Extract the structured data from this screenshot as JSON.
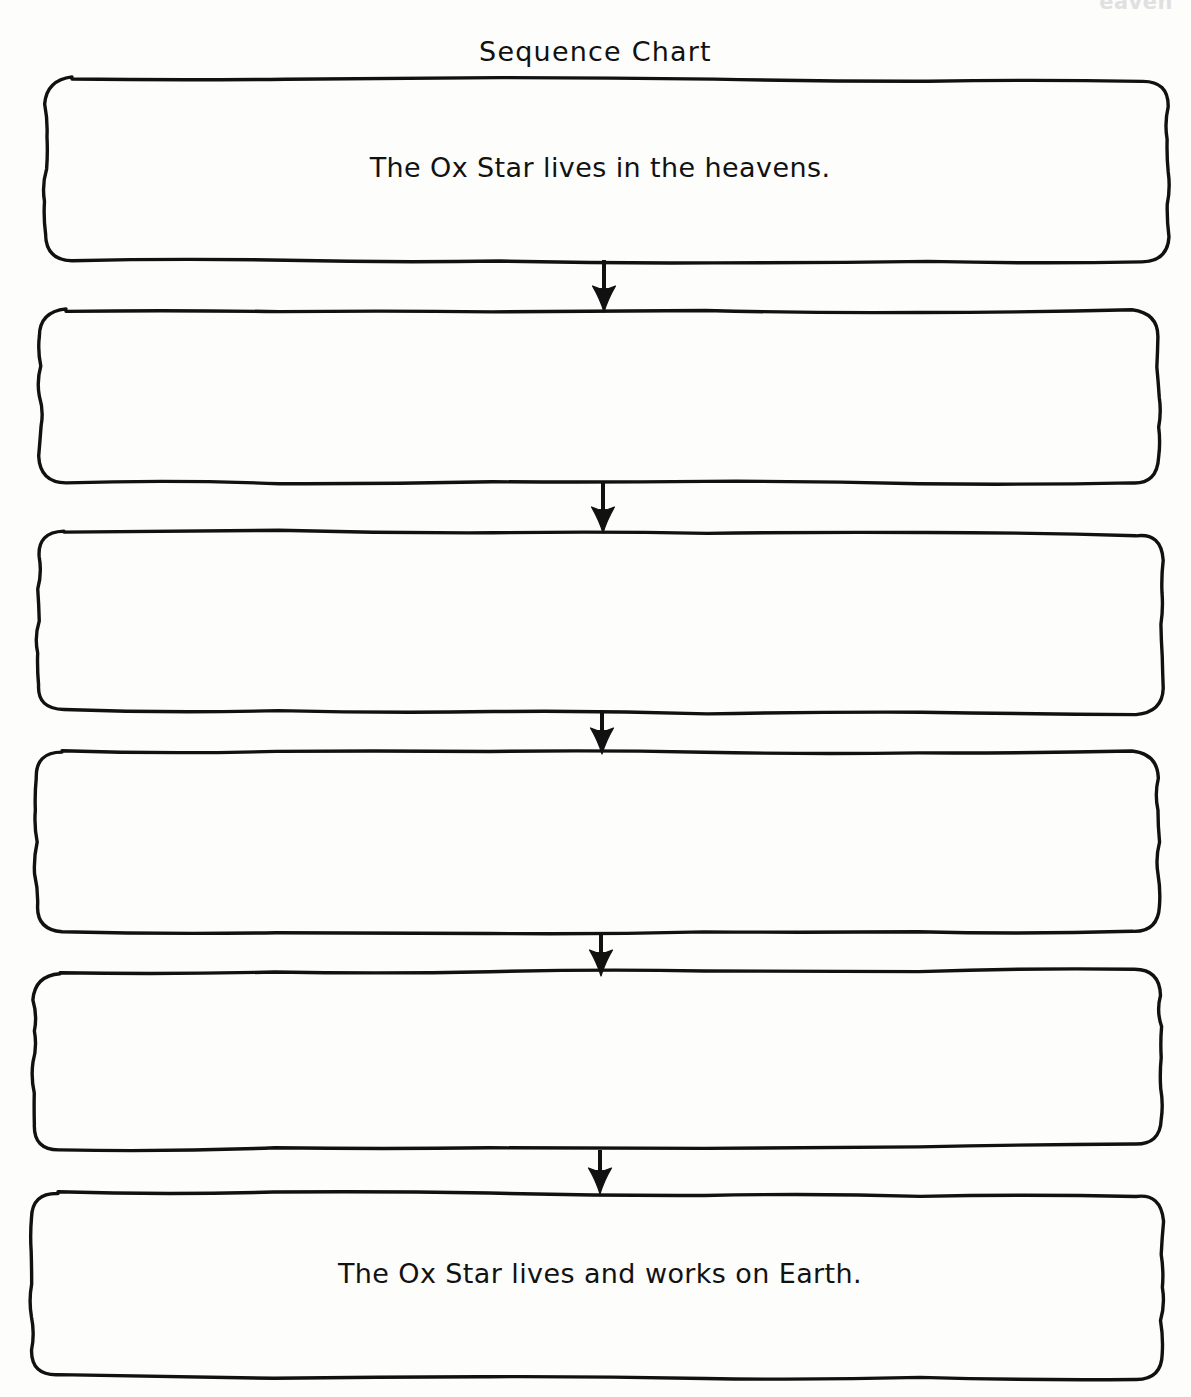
{
  "page": {
    "artifact_text": "eaven",
    "background_color": "#fdfdfc",
    "ink_color": "#111111",
    "width": 1191,
    "height": 1397
  },
  "header": {
    "title": "Sequence Chart"
  },
  "chart_data": {
    "type": "diagram",
    "subtype": "sequence-flowchart",
    "title": "Sequence Chart",
    "orientation": "vertical",
    "connector": "down-arrow",
    "node_count": 6,
    "filled_count": 2,
    "blank_count": 4,
    "nodes": [
      {
        "index": 1,
        "text": "The Ox Star lives in the heavens.",
        "filled": true
      },
      {
        "index": 2,
        "text": "",
        "filled": false
      },
      {
        "index": 3,
        "text": "",
        "filled": false
      },
      {
        "index": 4,
        "text": "",
        "filled": false
      },
      {
        "index": 5,
        "text": "",
        "filled": false
      },
      {
        "index": 6,
        "text": "The Ox Star lives and works on Earth.",
        "filled": true
      }
    ],
    "edges": [
      {
        "from": 1,
        "to": 2
      },
      {
        "from": 2,
        "to": 3
      },
      {
        "from": 3,
        "to": 4
      },
      {
        "from": 4,
        "to": 5
      },
      {
        "from": 5,
        "to": 6
      }
    ]
  },
  "boxes": [
    {
      "id": "box-1",
      "label": "The Ox Star lives in the heavens.",
      "x": 46,
      "y": 78,
      "w": 1122,
      "h": 182,
      "text_y": 152
    },
    {
      "id": "box-2",
      "label": "",
      "x": 40,
      "y": 310,
      "w": 1118,
      "h": 172,
      "text_y": 380
    },
    {
      "id": "box-3",
      "label": "",
      "x": 38,
      "y": 531,
      "w": 1124,
      "h": 180,
      "text_y": 605
    },
    {
      "id": "box-4",
      "label": "",
      "x": 36,
      "y": 752,
      "w": 1122,
      "h": 180,
      "text_y": 826
    },
    {
      "id": "box-5",
      "label": "",
      "x": 34,
      "y": 974,
      "w": 1126,
      "h": 176,
      "text_y": 1046
    },
    {
      "id": "box-6",
      "label": "The Ox Star lives and works on Earth.",
      "x": 32,
      "y": 1192,
      "w": 1130,
      "h": 184,
      "text_y": 1258
    }
  ],
  "arrows": [
    {
      "id": "arrow-1",
      "x": 604,
      "y_start": 260,
      "y_end": 312
    },
    {
      "id": "arrow-2",
      "x": 603,
      "y_start": 482,
      "y_end": 533
    },
    {
      "id": "arrow-3",
      "x": 602,
      "y_start": 711,
      "y_end": 754
    },
    {
      "id": "arrow-4",
      "x": 601,
      "y_start": 932,
      "y_end": 976
    },
    {
      "id": "arrow-5",
      "x": 600,
      "y_start": 1150,
      "y_end": 1194
    }
  ]
}
